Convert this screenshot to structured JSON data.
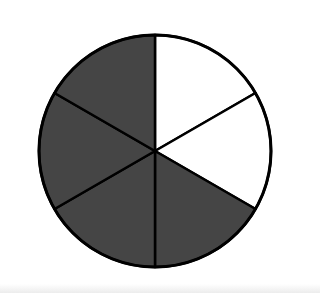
{
  "diagram": {
    "type": "fraction-circle",
    "description": "Circle divided into 6 equal sectors; 4 shaded, 2 unshaded",
    "total_parts": 6,
    "shaded_parts": 4,
    "unshaded_parts": 2,
    "colors": {
      "shaded": "#454545",
      "unshaded": "#ffffff",
      "outline": "#000000"
    },
    "sectors": [
      {
        "index": 0,
        "from_deg": -90,
        "to_deg": -30,
        "shaded": false
      },
      {
        "index": 1,
        "from_deg": -30,
        "to_deg": 30,
        "shaded": false
      },
      {
        "index": 2,
        "from_deg": 30,
        "to_deg": 90,
        "shaded": true
      },
      {
        "index": 3,
        "from_deg": 90,
        "to_deg": 150,
        "shaded": true
      },
      {
        "index": 4,
        "from_deg": 150,
        "to_deg": 210,
        "shaded": true
      },
      {
        "index": 5,
        "from_deg": 210,
        "to_deg": 270,
        "shaded": true
      }
    ],
    "geometry": {
      "cx": 155,
      "cy": 151,
      "r": 116
    }
  }
}
